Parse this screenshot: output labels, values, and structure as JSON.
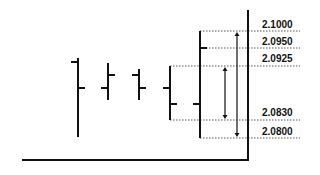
{
  "chart_data": {
    "type": "ohlc",
    "title": "",
    "xlabel": "",
    "ylabel": "",
    "grid": false,
    "legend": null,
    "price_levels": [
      {
        "label": "2.1000",
        "value": 2.1,
        "y": 31
      },
      {
        "label": "2.0950",
        "value": 2.095,
        "y": 48
      },
      {
        "label": "2.0925",
        "value": 2.0925,
        "y": 66
      },
      {
        "label": "2.0830",
        "value": 2.083,
        "y": 120
      },
      {
        "label": "2.0800",
        "value": 2.08,
        "y": 138
      }
    ],
    "bars": [
      {
        "x": 78,
        "high_y": 58,
        "low_y": 137,
        "open_y": 62,
        "close_y": 88
      },
      {
        "x": 108,
        "high_y": 63,
        "low_y": 100,
        "open_y": 88,
        "close_y": 75
      },
      {
        "x": 139,
        "high_y": 69,
        "low_y": 100,
        "open_y": 75,
        "close_y": 88
      },
      {
        "x": 170,
        "high_y": 66,
        "low_y": 120,
        "open_y": 88,
        "close_y": 104
      },
      {
        "x": 200,
        "high_y": 31,
        "low_y": 138,
        "open_y": 104,
        "close_y": 48
      }
    ],
    "range_arrows": [
      {
        "x": 225,
        "from_level": "2.0925",
        "to_level": "2.0830",
        "y1": 66,
        "y2": 120
      },
      {
        "x": 237,
        "from_level": "2.1000",
        "to_level": "2.0800",
        "y1": 31,
        "y2": 138
      }
    ],
    "dotted_guides": [
      {
        "x1": 200,
        "x2": 300,
        "y": 31
      },
      {
        "x1": 200,
        "x2": 300,
        "y": 48
      },
      {
        "x1": 170,
        "x2": 300,
        "y": 66
      },
      {
        "x1": 170,
        "x2": 300,
        "y": 120
      },
      {
        "x1": 200,
        "x2": 300,
        "y": 138
      }
    ],
    "axes": {
      "price_axis": {
        "x": 248,
        "y1": 10,
        "y2": 160
      },
      "time_axis": {
        "y": 160,
        "x1": 22,
        "x2": 248
      }
    }
  },
  "labels": {
    "l0": "2.1000",
    "l1": "2.0950",
    "l2": "2.0925",
    "l3": "2.0830",
    "l4": "2.0800"
  }
}
